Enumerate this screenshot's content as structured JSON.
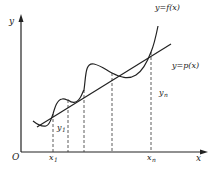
{
  "diagram": {
    "axes": {
      "y_label": "y",
      "x_label": "x",
      "origin_label": "O"
    },
    "curves": {
      "f_label": "y=f(x)",
      "p_label": "y=p(x)"
    },
    "points": {
      "x1": {
        "base": "x",
        "sub": "1"
      },
      "xn": {
        "base": "x",
        "sub": "n"
      },
      "y1": {
        "base": "y",
        "sub": "1"
      },
      "yn": {
        "base": "y",
        "sub": "n"
      }
    },
    "dashed_line_count": 5
  }
}
